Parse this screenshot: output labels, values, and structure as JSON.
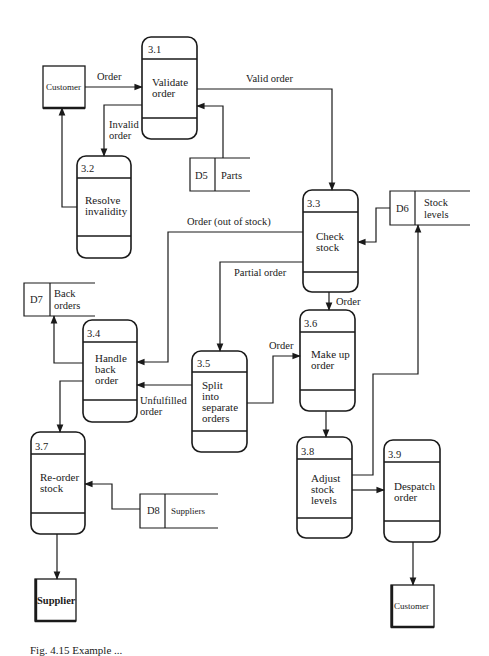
{
  "diagram": {
    "type": "data-flow-diagram",
    "processes": [
      {
        "id": "3.1",
        "number": "3.1",
        "lines": [
          "Validate",
          "order"
        ]
      },
      {
        "id": "3.2",
        "number": "3.2",
        "lines": [
          "Resolve",
          "invalidity"
        ]
      },
      {
        "id": "3.3",
        "number": "3.3",
        "lines": [
          "Check",
          "stock"
        ]
      },
      {
        "id": "3.4",
        "number": "3.4",
        "lines": [
          "Handle",
          "back",
          "order"
        ]
      },
      {
        "id": "3.5",
        "number": "3.5",
        "lines": [
          "Split",
          "into",
          "separate",
          "orders"
        ]
      },
      {
        "id": "3.6",
        "number": "3.6",
        "lines": [
          "Make up",
          "order"
        ]
      },
      {
        "id": "3.7",
        "number": "3.7",
        "lines": [
          "Re-order",
          "stock"
        ]
      },
      {
        "id": "3.8",
        "number": "3.8",
        "lines": [
          "Adjust",
          "stock",
          "levels"
        ]
      },
      {
        "id": "3.9",
        "number": "3.9",
        "lines": [
          "Despatch",
          "order"
        ]
      }
    ],
    "entities": {
      "customer_top": "Customer",
      "supplier": "Supplier",
      "customer_bottom": "Customer"
    },
    "stores": {
      "d5": {
        "id": "D5",
        "lines": [
          "Parts"
        ]
      },
      "d6": {
        "id": "D6",
        "lines": [
          "Stock",
          "levels"
        ]
      },
      "d7": {
        "id": "D7",
        "lines": [
          "Back",
          "orders"
        ]
      },
      "d8": {
        "id": "D8",
        "lines": [
          "Suppliers"
        ]
      }
    },
    "flows": {
      "customer_to_3_1": "Order",
      "valid_order": "Valid order",
      "invalid_order": [
        "Invalid",
        "order"
      ],
      "out_of_stock": "Order (out of stock)",
      "partial_order": "Partial order",
      "order_3_3_to_3_6": "Order",
      "order_3_5_to_3_6": "Order",
      "unfulfilled_order": [
        "Unfulfilled",
        "order"
      ]
    },
    "caption": "Fig. 4.15  Example ..."
  }
}
